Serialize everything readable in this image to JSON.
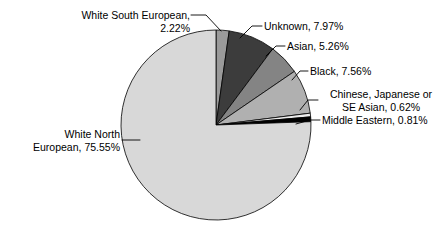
{
  "chart_data": {
    "type": "pie",
    "title": "",
    "categories": [
      "White South European",
      "Unknown",
      "Asian",
      "Black",
      "Chinese, Japanese or SE Asian",
      "Middle Eastern",
      "White North European"
    ],
    "values": [
      2.22,
      7.97,
      5.26,
      7.56,
      0.62,
      0.81,
      75.55
    ],
    "value_unit": "%",
    "slice_colors": [
      "#9a9a9a",
      "#3c3c3c",
      "#848484",
      "#b0b0b0",
      "#ededed",
      "#000000",
      "#d8d8d8"
    ],
    "start_angle_deg": 0,
    "direction": "clockwise",
    "legend": "none",
    "labels_placement": "outside-with-leader-lines",
    "grid": false
  },
  "labels": {
    "white_south_european": "White South European,\n2.22%",
    "unknown": "Unknown, 7.97%",
    "asian": "Asian, 5.26%",
    "black": "Black, 7.56%",
    "chinese_japanese_se_asian": "Chinese, Japanese or\nSE Asian, 0.62%",
    "middle_eastern": "Middle Eastern, 0.81%",
    "white_north_european": "White North\nEuropean, 75.55%"
  },
  "colors": {
    "background": "#ffffff",
    "text": "#000000",
    "outline": "#000000",
    "white_south_european": "#9a9a9a",
    "unknown": "#3c3c3c",
    "asian": "#848484",
    "black": "#b0b0b0",
    "chinese_japanese_se_asian": "#ededed",
    "middle_eastern": "#000000",
    "white_north_european": "#d8d8d8"
  }
}
